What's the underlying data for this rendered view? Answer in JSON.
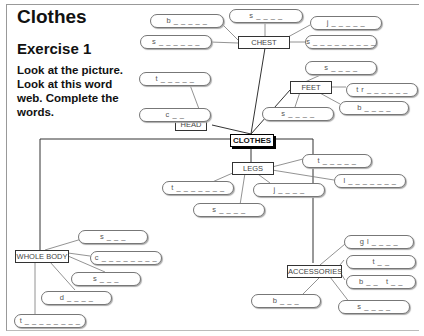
{
  "header": {
    "title": "Clothes",
    "exercise": "Exercise 1",
    "instructions": "Look at the picture. Look at this word web. Complete the words."
  },
  "center_node": "CLOTHES",
  "categories": {
    "chest": {
      "label": "CHEST",
      "words": [
        "b _ _ _ _ _",
        "s _ _ _ _ _ _",
        "s _ _ _ _",
        "j _ _ _ _ _",
        "s _ _ _ _ _ _ _ _ _"
      ]
    },
    "head": {
      "label": "HEAD",
      "words": [
        "t _ _ _ _ _",
        "c _ _"
      ]
    },
    "feet": {
      "label": "FEET",
      "words": [
        "s _ _ _ _",
        "t r _ _ _ _ _ _",
        "b _ _ _ _",
        "s _ _ _ _"
      ]
    },
    "legs": {
      "label": "LEGS",
      "words": [
        "t _ _ _ _ _",
        "l _ _ _ _ _ _ _",
        "t _ _ _ _ _ _ _",
        "j _ _ _ _",
        "s _ _ _ _"
      ]
    },
    "whole_body": {
      "label": "WHOLE BODY",
      "words": [
        "s _ _ _",
        "c _ _ _ _ _ _ _ _",
        "s _ _ _",
        "d _ _ _ _",
        "t _ _ _ _ _ _ _ _"
      ]
    },
    "accessories": {
      "label": "ACCESSORIES",
      "words": [
        "g l _ _ _ _",
        "t _ _",
        "b _ _   t _ _",
        "b _ _ _",
        "s _ _ _ _"
      ]
    }
  }
}
